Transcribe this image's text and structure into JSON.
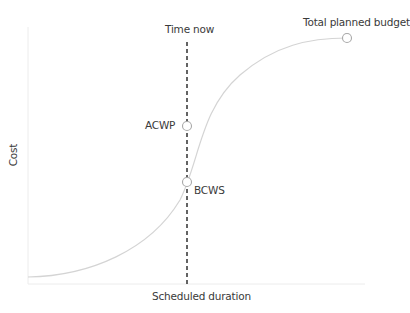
{
  "diagram": {
    "x_axis_label": "Scheduled duration",
    "y_axis_label": "Cost",
    "time_now_label": "Time now",
    "points": [
      {
        "id": "acwp",
        "label": "ACWP"
      },
      {
        "id": "bcws",
        "label": "BCWS"
      },
      {
        "id": "budget",
        "label": "Total planned budget"
      }
    ],
    "colors": {
      "curve": "#d4d4d4",
      "axis": "#ececec",
      "dashed_line": "#222222",
      "marker_stroke": "#a8a8a8",
      "text": "#3a3a3a"
    }
  }
}
